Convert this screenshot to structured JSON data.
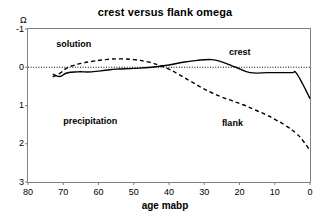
{
  "chart_data": {
    "type": "line",
    "title": "crest versus flank omega",
    "xlabel": "age mabp",
    "ylabel": "Ω",
    "xlim": [
      80,
      0
    ],
    "ylim": [
      -1,
      3
    ],
    "y_inverted": true,
    "grid": false,
    "legend": "inline-annotations",
    "xticks": [
      "80",
      "70",
      "60",
      "50",
      "40",
      "30",
      "20",
      "10",
      "0"
    ],
    "yticks": [
      "-1",
      "0",
      "1",
      "2",
      "3"
    ],
    "zero_line": 0,
    "annotations": [
      {
        "text": "solution",
        "x": 72,
        "y": -0.6
      },
      {
        "text": "precipitation",
        "x": 70,
        "y": 1.4
      },
      {
        "text": "crest",
        "x": 23,
        "y": -0.4
      },
      {
        "text": "flank",
        "x": 25,
        "y": 1.45
      }
    ],
    "series": [
      {
        "name": "crest",
        "style": "solid",
        "color": "#000000",
        "x": [
          73,
          71,
          69,
          66,
          62,
          58,
          55,
          50,
          45,
          40,
          36,
          32,
          28,
          25,
          22,
          21,
          17,
          12,
          8,
          5,
          4,
          2,
          0
        ],
        "y": [
          0.18,
          0.24,
          0.15,
          0.12,
          0.12,
          0.08,
          0.05,
          0.03,
          0.0,
          -0.06,
          -0.13,
          -0.18,
          -0.2,
          -0.14,
          -0.03,
          0.0,
          0.14,
          0.14,
          0.14,
          0.14,
          0.14,
          0.45,
          0.82
        ]
      },
      {
        "name": "flank",
        "style": "dashed",
        "color": "#000000",
        "x": [
          73,
          71,
          69,
          67,
          65,
          62,
          58,
          54,
          50,
          46,
          43,
          40,
          37,
          34,
          31,
          28,
          25,
          22,
          19,
          16,
          13,
          10,
          7,
          4,
          2,
          0
        ],
        "y": [
          0.25,
          0.16,
          0.02,
          -0.05,
          -0.1,
          -0.15,
          -0.2,
          -0.22,
          -0.2,
          -0.14,
          -0.06,
          0.05,
          0.2,
          0.36,
          0.52,
          0.66,
          0.78,
          0.88,
          0.98,
          1.1,
          1.22,
          1.36,
          1.52,
          1.72,
          1.92,
          2.18
        ]
      }
    ]
  }
}
